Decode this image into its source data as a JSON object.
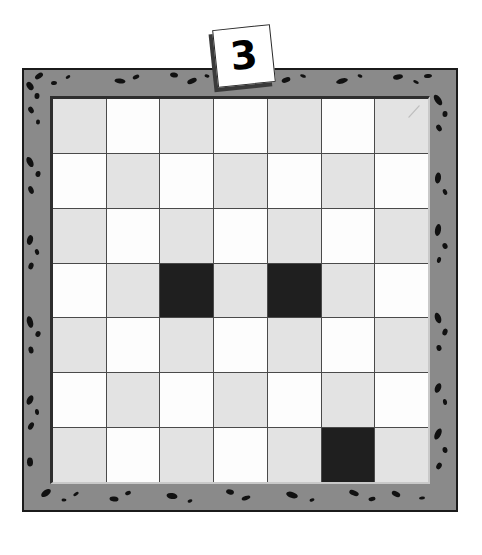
{
  "scene": {
    "kind": "puzzle-board-illustration",
    "background_color": "#ffffff",
    "width": 482,
    "height": 555
  },
  "number_tile": {
    "value": "3",
    "shape": "square-card",
    "rotation_degrees": -6,
    "fill_color": "#ffffff",
    "outline_color": "#2a2a2a",
    "shadow_color": "#3a3a3a",
    "position": "top-center, overlapping board frame"
  },
  "board": {
    "frame": {
      "fill_color": "#8a8a8a",
      "outline_color": "#1b1b1b",
      "speckle_color": "#111111",
      "texture_name": "granite-speckle-border"
    },
    "bevel": {
      "shadow_color": "#2e2e2e",
      "highlight_color": "#c9c9c9"
    },
    "grid": {
      "rows": 7,
      "columns": 7,
      "line_color": "#4a4a4a",
      "light_color": "#e3e3e3",
      "white_color": "#fdfdfd",
      "dark_color": "#1f1f1f",
      "pattern_note": "alternating checkerboard of light-gray and white, with three filled black squares",
      "cells": [
        [
          "light",
          "white",
          "light",
          "white",
          "light",
          "white",
          "light"
        ],
        [
          "white",
          "light",
          "white",
          "light",
          "white",
          "light",
          "white"
        ],
        [
          "light",
          "white",
          "light",
          "white",
          "light",
          "white",
          "light"
        ],
        [
          "white",
          "light",
          "dark",
          "light",
          "dark",
          "light",
          "white"
        ],
        [
          "light",
          "white",
          "light",
          "white",
          "light",
          "white",
          "light"
        ],
        [
          "white",
          "light",
          "white",
          "light",
          "white",
          "light",
          "white"
        ],
        [
          "light",
          "white",
          "light",
          "white",
          "light",
          "dark",
          "light"
        ]
      ],
      "filled_squares": [
        {
          "row": 4,
          "column": 3
        },
        {
          "row": 4,
          "column": 5
        },
        {
          "row": 7,
          "column": 6
        }
      ],
      "filled_count": 3,
      "annotations": [
        {
          "row": 1,
          "column": 7,
          "mark": "faint-diagonal-pencil-stroke"
        }
      ]
    }
  },
  "frame_speckles": {
    "top": [
      [
        15,
        6,
        9,
        5
      ],
      [
        30,
        13,
        6,
        4
      ],
      [
        44,
        7,
        5,
        3
      ],
      [
        96,
        11,
        11,
        5
      ],
      [
        112,
        7,
        7,
        4
      ],
      [
        150,
        5,
        8,
        5
      ],
      [
        168,
        11,
        10,
        5
      ],
      [
        183,
        6,
        5,
        3
      ],
      [
        262,
        10,
        9,
        5
      ],
      [
        279,
        6,
        6,
        3
      ],
      [
        318,
        11,
        12,
        5
      ],
      [
        336,
        6,
        5,
        3
      ],
      [
        374,
        7,
        10,
        5
      ],
      [
        392,
        12,
        6,
        3
      ],
      [
        404,
        6,
        8,
        4
      ]
    ],
    "bottom": [
      [
        22,
        7,
        11,
        6
      ],
      [
        40,
        14,
        5,
        3
      ],
      [
        52,
        8,
        6,
        3
      ],
      [
        90,
        13,
        9,
        5
      ],
      [
        104,
        7,
        6,
        4
      ],
      [
        148,
        10,
        11,
        6
      ],
      [
        166,
        15,
        5,
        3
      ],
      [
        206,
        6,
        8,
        5
      ],
      [
        222,
        12,
        9,
        4
      ],
      [
        268,
        9,
        12,
        6
      ],
      [
        288,
        14,
        5,
        3
      ],
      [
        330,
        7,
        10,
        5
      ],
      [
        348,
        13,
        7,
        4
      ],
      [
        372,
        8,
        9,
        5
      ],
      [
        398,
        12,
        6,
        3
      ]
    ],
    "left": [
      [
        6,
        16,
        6,
        9
      ],
      [
        13,
        26,
        5,
        6
      ],
      [
        7,
        40,
        5,
        7
      ],
      [
        14,
        52,
        4,
        5
      ],
      [
        6,
        92,
        6,
        11
      ],
      [
        14,
        104,
        5,
        6
      ],
      [
        7,
        120,
        5,
        8
      ],
      [
        6,
        170,
        6,
        10
      ],
      [
        13,
        182,
        4,
        6
      ],
      [
        7,
        196,
        5,
        7
      ],
      [
        6,
        252,
        6,
        12
      ],
      [
        14,
        264,
        5,
        6
      ],
      [
        7,
        280,
        5,
        7
      ],
      [
        6,
        330,
        6,
        10
      ],
      [
        13,
        342,
        4,
        6
      ],
      [
        7,
        356,
        5,
        8
      ],
      [
        6,
        392,
        6,
        9
      ]
    ],
    "right": [
      [
        6,
        30,
        6,
        12
      ],
      [
        13,
        44,
        5,
        6
      ],
      [
        7,
        58,
        5,
        7
      ],
      [
        6,
        108,
        6,
        11
      ],
      [
        13,
        122,
        4,
        6
      ],
      [
        6,
        160,
        6,
        12
      ],
      [
        13,
        176,
        5,
        6
      ],
      [
        7,
        190,
        4,
        6
      ],
      [
        6,
        248,
        6,
        11
      ],
      [
        13,
        262,
        5,
        7
      ],
      [
        7,
        278,
        5,
        6
      ],
      [
        6,
        318,
        6,
        10
      ],
      [
        13,
        332,
        4,
        6
      ],
      [
        6,
        364,
        6,
        12
      ],
      [
        13,
        380,
        5,
        6
      ],
      [
        7,
        396,
        5,
        7
      ]
    ]
  }
}
